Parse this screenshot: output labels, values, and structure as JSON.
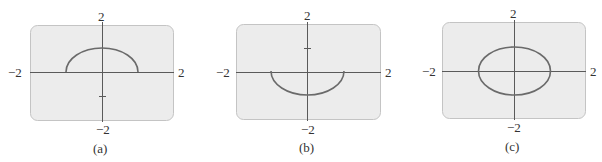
{
  "figure": {
    "panels": [
      {
        "id": "a",
        "caption": "(a)",
        "x_min_label": "−2",
        "x_max_label": "2",
        "y_max_label": "2",
        "y_min_label": "−2",
        "curve": "upper semicircle",
        "curve_description": "Upper half of a circle of radius 1 centered at origin"
      },
      {
        "id": "b",
        "caption": "(b)",
        "x_min_label": "−2",
        "x_max_label": "2",
        "y_max_label": "2",
        "y_min_label": "−2",
        "curve": "lower semicircle",
        "curve_description": "Lower half of a circle of radius 1 centered at origin"
      },
      {
        "id": "c",
        "caption": "(c)",
        "x_min_label": "−2",
        "x_max_label": "2",
        "y_max_label": "2",
        "y_min_label": "−2",
        "curve": "full circle",
        "curve_description": "Circle of radius 1 centered at origin"
      }
    ],
    "colors": {
      "panel_fill": "#ececec",
      "panel_border": "#c4c4c4",
      "axis": "#5a5a5a",
      "curve": "#6a6a6a",
      "text": "#333333"
    }
  }
}
